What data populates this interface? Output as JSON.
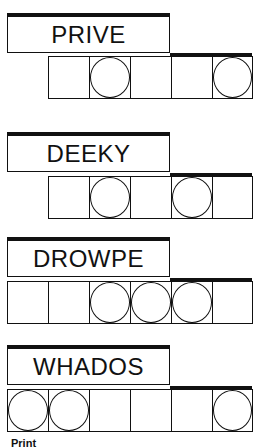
{
  "puzzles": [
    {
      "scrambled": "PRIVE",
      "cells": 5,
      "offset_cells": 1,
      "circled": [
        2,
        5
      ]
    },
    {
      "scrambled": "DEEKY",
      "cells": 5,
      "offset_cells": 1,
      "circled": [
        2,
        4
      ]
    },
    {
      "scrambled": "DROWPE",
      "cells": 6,
      "offset_cells": 0,
      "circled": [
        3,
        4,
        5
      ]
    },
    {
      "scrambled": "WHADOS",
      "cells": 6,
      "offset_cells": 0,
      "circled": [
        1,
        2,
        6
      ]
    }
  ],
  "footer": {
    "text": "Print"
  }
}
